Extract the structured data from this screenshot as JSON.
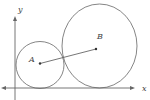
{
  "diagram": {
    "type": "geometry",
    "axes": {
      "x_label": "x",
      "y_label": "y",
      "origin_px": [
        15,
        88
      ]
    },
    "circles": [
      {
        "name": "small-circle",
        "center_label": "A",
        "center_px": [
          40,
          65
        ],
        "rx_px": 24,
        "ry_px": 23.5
      },
      {
        "name": "large-circle",
        "center_label": "B",
        "center_px": [
          99.5,
          46
        ],
        "rx_px": 37.5,
        "ry_px": 42
      }
    ],
    "points": [
      {
        "label": "A",
        "px": [
          40,
          63.5
        ]
      },
      {
        "label": "B",
        "px": [
          96,
          49
        ]
      }
    ],
    "segment": {
      "from": "A",
      "to": "B"
    },
    "colors": {
      "stroke": "#666666",
      "text": "#444444",
      "background": "#ffffff"
    }
  }
}
